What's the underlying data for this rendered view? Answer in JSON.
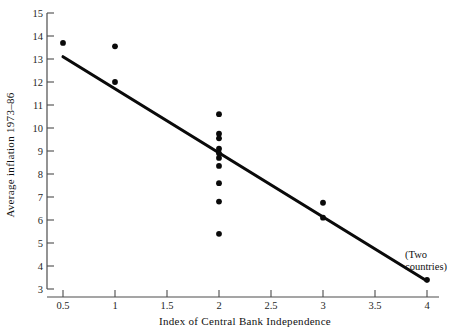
{
  "chart_data": {
    "type": "scatter",
    "title": "",
    "xlabel": "Index of Central Bank Independence",
    "ylabel": "Average inflation 1973–86",
    "xlim": [
      0.5,
      4.0
    ],
    "ylim": [
      3,
      15
    ],
    "xticks": [
      0.5,
      1,
      1.5,
      2,
      2.5,
      3,
      3.5,
      4
    ],
    "xtick_labels": [
      "0.5",
      "1",
      "1.5",
      "2",
      "2.5",
      "3",
      "3.5",
      "4"
    ],
    "yticks": [
      3,
      4,
      5,
      6,
      7,
      8,
      9,
      10,
      11,
      12,
      13,
      14,
      15
    ],
    "ytick_labels": [
      "3",
      "4",
      "5",
      "6",
      "7",
      "8",
      "9",
      "10",
      "11",
      "12",
      "13",
      "14",
      "15"
    ],
    "grid": false,
    "legend": false,
    "marker": "filled-circle",
    "marker_color": "#0a0a0a",
    "points": [
      {
        "x": 0.5,
        "y": 13.7
      },
      {
        "x": 1.0,
        "y": 13.55
      },
      {
        "x": 1.0,
        "y": 12.0
      },
      {
        "x": 2.0,
        "y": 10.6
      },
      {
        "x": 2.0,
        "y": 9.75
      },
      {
        "x": 2.0,
        "y": 9.55
      },
      {
        "x": 2.0,
        "y": 9.1
      },
      {
        "x": 2.0,
        "y": 8.9
      },
      {
        "x": 2.0,
        "y": 8.7
      },
      {
        "x": 2.0,
        "y": 8.35
      },
      {
        "x": 2.0,
        "y": 7.6
      },
      {
        "x": 2.0,
        "y": 6.8
      },
      {
        "x": 2.0,
        "y": 5.4
      },
      {
        "x": 3.0,
        "y": 6.75
      },
      {
        "x": 3.0,
        "y": 6.1
      },
      {
        "x": 4.0,
        "y": 3.4
      }
    ],
    "fit_line": {
      "type": "linear-trend",
      "x_start": 0.5,
      "y_start": 13.1,
      "x_end": 4.0,
      "y_end": 3.35,
      "color": "#0a0a0a"
    },
    "annotations": [
      {
        "name": "two-countries-note",
        "text_line1": "(Two",
        "text_line2": "countries)",
        "x": 4.0,
        "y": 4.35
      }
    ]
  }
}
